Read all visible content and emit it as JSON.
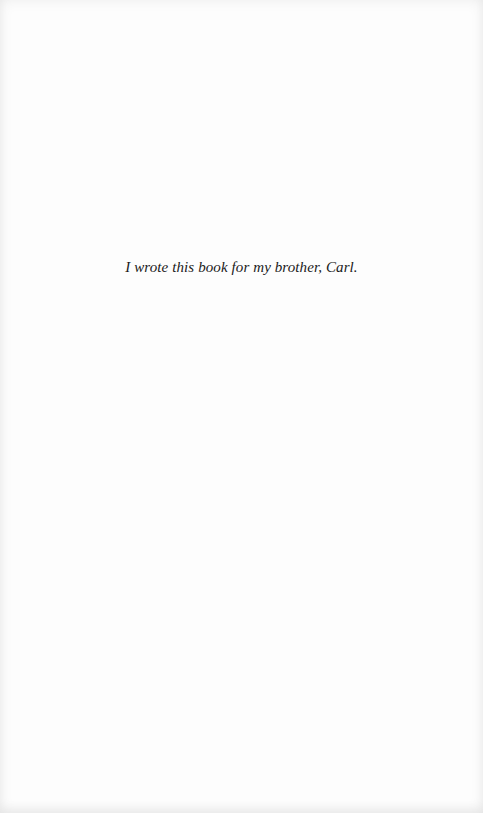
{
  "page": {
    "type": "dedication",
    "background_color": "#fdfdfd",
    "text_color": "#1a1a1a"
  },
  "dedication": {
    "text": "I wrote this book for my brother, Carl."
  }
}
